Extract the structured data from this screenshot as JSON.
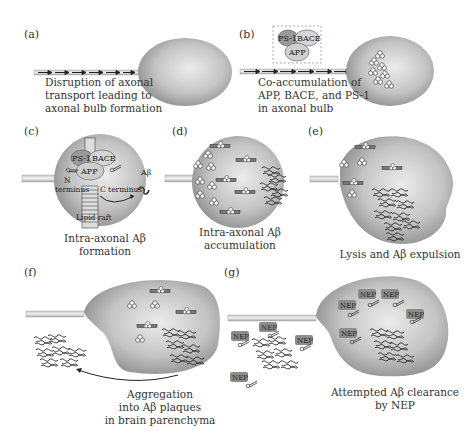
{
  "panels": {
    "a": {
      "label": "(a)",
      "caption": [
        "Disruption of axonal",
        "transport leading to",
        "axonal bulb formation"
      ]
    },
    "b": {
      "label": "(b)",
      "caption": [
        "Co-accumulation of",
        "APP, BACE, and PS-1",
        "in axonal bulb"
      ],
      "inset": {
        "ps1": "PS-1",
        "bace": "BACE",
        "app": "APP"
      }
    },
    "c": {
      "label": "(c)",
      "caption": [
        "Intra-axonal Aβ formation"
      ],
      "labels": {
        "ps1": "PS-1",
        "bace": "BACE",
        "app": "APP",
        "n_terminus_1": "N",
        "n_terminus_2": "terminus",
        "c_terminus": "C terminus",
        "abeta": "Aβ",
        "lipid_raft": "Lipid raft"
      }
    },
    "d": {
      "label": "(d)",
      "caption": [
        "Intra-axonal Aβ",
        "accumulation"
      ]
    },
    "e": {
      "label": "(e)",
      "caption": [
        "Lysis and Aβ expulsion"
      ]
    },
    "f": {
      "label": "(f)",
      "caption": [
        "Aggregation",
        "into Aβ plaques",
        "in brain parenchyma"
      ]
    },
    "g": {
      "label": "(g)",
      "caption": [
        "Attempted Aβ clearance",
        "by NEP"
      ],
      "enzyme": "NEP"
    }
  },
  "colors": {
    "bulb_light": "#e4e4e4",
    "bulb_dark": "#8a8a8a",
    "fiber": "#444444",
    "nep_box": "#8c8c8c"
  }
}
